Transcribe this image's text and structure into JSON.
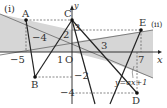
{
  "figure": {
    "panel_labels": {
      "i": "(i)",
      "ii": "(ii)"
    },
    "axes": {
      "x_label": "x",
      "y_label": "y",
      "origin_label": "O"
    },
    "points": {
      "A": {
        "label": "A",
        "coords": [
          -5,
          3
        ]
      },
      "B": {
        "label": "B",
        "coords": [
          -4,
          -2
        ]
      },
      "C": {
        "label": "C",
        "coords": [
          0,
          3
        ]
      },
      "D": {
        "label": "D",
        "coords": [
          6.5,
          -4
        ]
      },
      "E": {
        "label": "E",
        "coords": [
          7,
          2.5
        ]
      }
    },
    "tick_labels": {
      "x_neg5": "−5",
      "x_neg4": "−4",
      "x_1": "1",
      "x_3": "3",
      "x_7": "7",
      "y_3": "3",
      "y_2": "2",
      "y_neg2": "−2",
      "y_neg4": "−4"
    },
    "line_label": "y=ax+1",
    "colors": {
      "shade": "#d4d4d4",
      "line": "#222222",
      "dash": "#555555"
    }
  }
}
